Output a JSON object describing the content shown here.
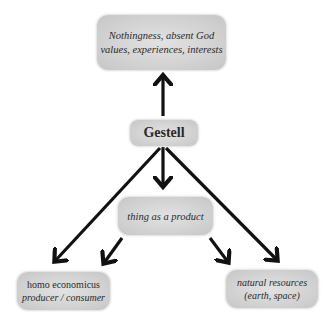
{
  "diagram": {
    "type": "flow-tree",
    "nodes": {
      "top": {
        "lines": [
          "Nothingness, absent God",
          "values, experiences, interests"
        ],
        "style": "italic"
      },
      "gestell": {
        "lines": [
          "Gestell"
        ],
        "style": "bold"
      },
      "thing": {
        "lines": [
          "thing as a product"
        ],
        "style": "italic"
      },
      "homo": {
        "lines": [
          "homo economicus",
          "producer / consumer"
        ],
        "style": "mixed"
      },
      "natural": {
        "lines": [
          "natural resources",
          "(earth, space)"
        ],
        "style": "italic"
      }
    },
    "edges": [
      {
        "from": "gestell",
        "to": "top"
      },
      {
        "from": "gestell",
        "to": "thing"
      },
      {
        "from": "gestell",
        "to": "homo"
      },
      {
        "from": "gestell",
        "to": "natural"
      },
      {
        "from": "thing",
        "to": "homo"
      },
      {
        "from": "thing",
        "to": "natural"
      }
    ],
    "colors": {
      "node_fill": "#d2d2d2",
      "arrow": "#111111",
      "text": "#2a2a2a",
      "background": "#ffffff"
    }
  }
}
